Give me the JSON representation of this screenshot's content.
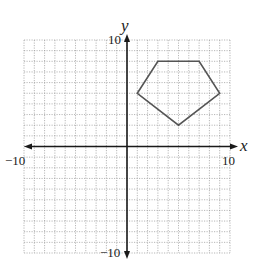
{
  "chart_data": {
    "type": "scatter",
    "title": "",
    "xlabel": "x",
    "ylabel": "y",
    "xlim": [
      -10,
      10
    ],
    "ylim": [
      -10,
      10
    ],
    "grid": true,
    "grid_style": "dotted",
    "tick_labels": {
      "x_min": "−10",
      "x_max": "10",
      "y_min": "−10",
      "y_max": "10"
    },
    "series": [
      {
        "name": "pentagon",
        "shape": "polygon",
        "closed": true,
        "points": [
          [
            1,
            5
          ],
          [
            3,
            8
          ],
          [
            7,
            8
          ],
          [
            9,
            5
          ],
          [
            5,
            2
          ]
        ]
      }
    ],
    "colors": {
      "grid": "#9a9a9a",
      "axes": "#1a1a1a",
      "polygon": "#555555"
    }
  }
}
